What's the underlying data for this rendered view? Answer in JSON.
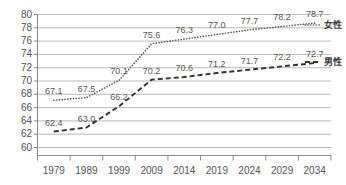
{
  "chart_data": {
    "type": "line",
    "title": "",
    "xlabel": "",
    "ylabel": "",
    "categories": [
      "1979",
      "1989",
      "1999",
      "2009",
      "2014",
      "2019",
      "2024",
      "2029",
      "2034"
    ],
    "ylim": [
      60,
      80
    ],
    "ytick_step": 2,
    "yticks": [
      "80",
      "78",
      "76",
      "74",
      "72",
      "70",
      "68",
      "66",
      "64",
      "62",
      "60"
    ],
    "grid": true,
    "legend_position": "right",
    "series": [
      {
        "name": "女性",
        "style": "dotted",
        "color": "#595959",
        "values": [
          67.1,
          67.5,
          70.1,
          75.6,
          76.3,
          77.0,
          77.7,
          78.2,
          78.7
        ],
        "labels": [
          "67.1",
          "67.5",
          "70.1",
          "75.6",
          "76.3",
          "77.0",
          "77.7",
          "78.2",
          "78.7"
        ]
      },
      {
        "name": "男性",
        "style": "dashed",
        "color": "#333333",
        "values": [
          62.4,
          63.0,
          66.2,
          70.2,
          70.6,
          71.2,
          71.7,
          72.2,
          72.7
        ],
        "labels": [
          "62.4",
          "63.0",
          "66.2",
          "70.2",
          "70.6",
          "71.2",
          "71.7",
          "72.2",
          "72.7"
        ]
      }
    ]
  },
  "legend": {
    "female_label": "女性",
    "male_label": "男性"
  },
  "axis": {
    "y_ticks": [
      {
        "value": "80"
      },
      {
        "value": "78"
      },
      {
        "value": "76"
      },
      {
        "value": "74"
      },
      {
        "value": "72"
      },
      {
        "value": "70"
      },
      {
        "value": "68"
      },
      {
        "value": "66"
      },
      {
        "value": "64"
      },
      {
        "value": "62"
      },
      {
        "value": "60"
      }
    ],
    "x_ticks": [
      {
        "value": "1979"
      },
      {
        "value": "1989"
      },
      {
        "value": "1999"
      },
      {
        "value": "2009"
      },
      {
        "value": "2014"
      },
      {
        "value": "2019"
      },
      {
        "value": "2024"
      },
      {
        "value": "2029"
      },
      {
        "value": "2034"
      }
    ]
  }
}
